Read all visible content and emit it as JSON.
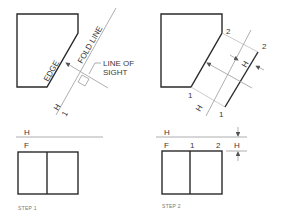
{
  "figure": {
    "step1": {
      "caption": "STEP 1",
      "labels": {
        "edge": "EDGE",
        "fold_line": "FOLD LINE",
        "line_of_sight_1": "LINE OF",
        "line_of_sight_2": "SIGHT",
        "fold_h": "H",
        "fold_1": "1",
        "top_h": "H",
        "top_f": "F"
      }
    },
    "step2": {
      "caption": "STEP 2",
      "labels": {
        "pt2_top": "2",
        "pt2_aux": "2",
        "pt1_top": "1",
        "pt1_aux": "1",
        "dim_h_aux": "H",
        "fold_h": "H",
        "top_h": "H",
        "top_f": "F",
        "front_1": "1",
        "front_2": "2",
        "dim_h_front": "H"
      }
    },
    "colors": {
      "object_line": "#2a2a2a",
      "construction_line": "#9a9a9a",
      "text": "#3a3a3a"
    }
  }
}
